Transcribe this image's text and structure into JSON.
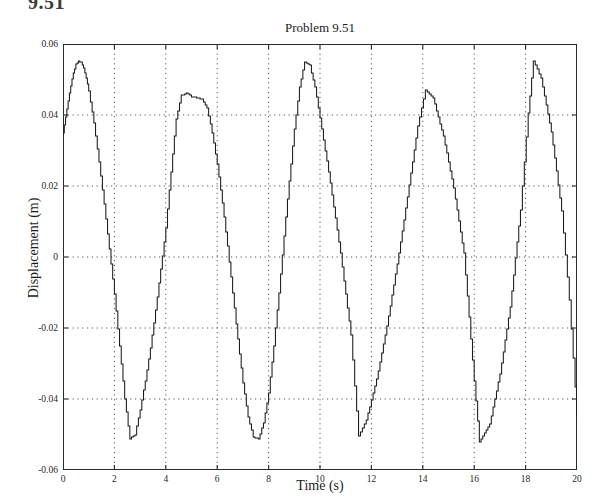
{
  "section_heading": "9.51",
  "figure": {
    "title": "Problem 9.51",
    "xlabel": "Time (s)",
    "ylabel": "Displacement (m)"
  },
  "colors": {
    "line": "#1a1a1a",
    "axis": "#2a2a2a",
    "grid": "#555555",
    "background": "#ffffff"
  },
  "chart_data": {
    "type": "line",
    "title": "Problem 9.51",
    "xlabel": "Time (s)",
    "ylabel": "Displacement (m)",
    "xlim": [
      0,
      20
    ],
    "ylim": [
      -0.06,
      0.06
    ],
    "xticks": [
      0,
      2,
      4,
      6,
      8,
      10,
      12,
      14,
      16,
      18,
      20
    ],
    "xticklabels": [
      "0",
      "2",
      "4",
      "6",
      "8",
      "10",
      "12",
      "14",
      "16",
      "18",
      "20"
    ],
    "yticks": [
      0.06,
      0.04,
      0.02,
      0,
      -0.02,
      -0.04,
      -0.06
    ],
    "yticklabels": [
      "0.06",
      "0.04",
      "0.02",
      "0",
      "-0.02",
      "-0.04",
      "-0.06"
    ],
    "grid": true,
    "grid_style": "dotted",
    "legend": null,
    "series": [
      {
        "name": "displacement",
        "x": [
          0.0,
          0.1,
          0.2,
          0.3,
          0.4,
          0.5,
          0.6,
          0.7,
          0.8,
          0.9,
          1.0,
          1.2,
          1.4,
          1.6,
          1.8,
          2.0,
          2.2,
          2.4,
          2.6,
          2.8,
          3.0,
          3.2,
          3.4,
          3.6,
          3.8,
          4.0,
          4.2,
          4.4,
          4.6,
          4.8,
          5.0,
          5.2,
          5.4,
          5.6,
          5.8,
          6.0,
          6.2,
          6.4,
          6.6,
          6.8,
          7.0,
          7.2,
          7.4,
          7.6,
          7.8,
          8.0,
          8.2,
          8.4,
          8.6,
          8.8,
          9.0,
          9.2,
          9.4,
          9.6,
          9.8,
          10.0,
          10.4,
          10.8,
          11.2,
          11.5,
          11.8,
          12.2,
          12.6,
          13.0,
          13.4,
          13.8,
          14.1,
          14.4,
          14.8,
          15.2,
          15.6,
          16.0,
          16.2,
          16.6,
          17.0,
          17.4,
          17.8,
          18.1,
          18.3,
          18.6,
          19.0,
          19.4,
          19.7,
          20.0
        ],
        "y": [
          0.035,
          0.0395,
          0.044,
          0.0482,
          0.0518,
          0.0543,
          0.0552,
          0.0548,
          0.0532,
          0.0505,
          0.0468,
          0.0378,
          0.0268,
          0.0148,
          0.0022,
          -0.0105,
          -0.025,
          -0.04,
          -0.0512,
          -0.05,
          -0.043,
          -0.0348,
          -0.0255,
          -0.015,
          -0.0035,
          0.0082,
          0.024,
          0.039,
          0.0455,
          0.0462,
          0.0452,
          0.0448,
          0.0445,
          0.042,
          0.035,
          0.0262,
          0.0152,
          0.003,
          -0.01,
          -0.0232,
          -0.0355,
          -0.045,
          -0.0508,
          -0.0512,
          -0.0468,
          -0.0382,
          -0.0252,
          -0.01,
          0.006,
          0.0215,
          0.036,
          0.0478,
          0.055,
          0.054,
          0.0478,
          0.0392,
          0.0208,
          0.001,
          -0.022,
          -0.0505,
          -0.046,
          -0.0345,
          -0.0195,
          -0.002,
          0.0168,
          0.037,
          0.047,
          0.0448,
          0.034,
          0.0195,
          0.001,
          -0.035,
          -0.052,
          -0.047,
          -0.033,
          -0.014,
          0.0132,
          0.0405,
          0.0552,
          0.0505,
          0.0352,
          0.013,
          -0.012,
          -0.045
        ]
      }
    ]
  }
}
